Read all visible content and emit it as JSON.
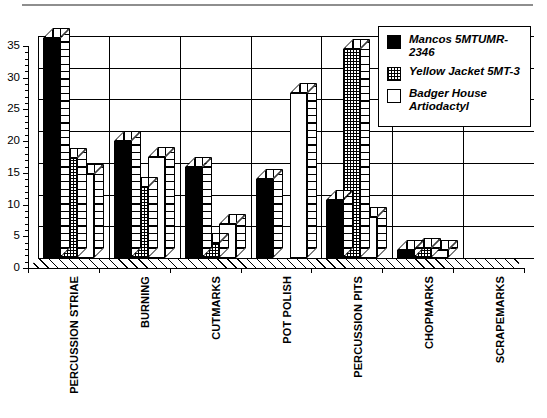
{
  "chart_data": {
    "type": "bar",
    "title": "",
    "subtitle": "",
    "xlabel": "",
    "ylabel": "",
    "ylim": [
      0,
      35
    ],
    "yticks": [
      0,
      5,
      10,
      15,
      20,
      25,
      30,
      35
    ],
    "ytick_labels": [
      "0",
      "5",
      "10",
      "15",
      "20",
      "25",
      "30",
      "35"
    ],
    "minor_tick_step": 1,
    "grid": true,
    "grid_axis": "y",
    "legend_position": "upper-right",
    "style": "3d-grouped-bar",
    "categories": [
      "PERCUSSION STRIAE",
      "BURNING",
      "CUTMARKS",
      "POT POLISH",
      "PERCUSSION PITS",
      "CHOPMARKS",
      "SCRAPEMARKS"
    ],
    "series": [
      {
        "name": "Mancos 5MTUMR-2346",
        "fill": "solid-black",
        "color": "#000000",
        "values": [
          34.7,
          18.5,
          14.4,
          12.5,
          9.2,
          1.2,
          0
        ]
      },
      {
        "name": "Yellow Jacket 5MT-3",
        "fill": "checkered",
        "color": "#ffffff",
        "values": [
          15.7,
          11.2,
          2.3,
          0,
          33.0,
          1.5,
          0
        ]
      },
      {
        "name": "Badger House Artiodactyl",
        "fill": "white",
        "color": "#ffffff",
        "values": [
          13.2,
          16.0,
          5.3,
          26.0,
          6.5,
          1.3,
          0
        ]
      }
    ]
  },
  "legend": {
    "entries": [
      {
        "label": "Mancos 5MTUMR-2346",
        "swatch": "solid-black"
      },
      {
        "label": "Yellow Jacket 5MT-3",
        "swatch": "checkered"
      },
      {
        "label": "Badger House Artiodactyl",
        "swatch": "white"
      }
    ]
  },
  "axes": {
    "y_tick_labels": [
      "0",
      "5",
      "10",
      "15",
      "20",
      "25",
      "30",
      "35"
    ],
    "x_tick_labels": [
      "PERCUSSION STRIAE",
      "BURNING",
      "CUTMARKS",
      "POT POLISH",
      "PERCUSSION PITS",
      "CHOPMARKS",
      "SCRAPEMARKS"
    ]
  }
}
